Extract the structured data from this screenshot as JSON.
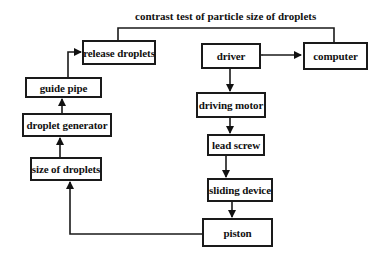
{
  "diagram": {
    "title": "contrast test of particle size of droplets",
    "nodes": {
      "release_droplets": "release droplets",
      "guide_pipe": "guide pipe",
      "droplet_generator": "droplet generator",
      "size_of_droplets": "size of droplets",
      "driver": "driver",
      "computer": "computer",
      "driving_motor": "driving motor",
      "lead_screw": "lead screw",
      "sliding_device": "sliding device",
      "piston": "piston"
    },
    "edges": [
      {
        "from": "driver",
        "to": "computer",
        "bidirectional": true
      },
      {
        "from": "driver",
        "to": "driving_motor"
      },
      {
        "from": "driving_motor",
        "to": "lead_screw"
      },
      {
        "from": "lead_screw",
        "to": "sliding_device"
      },
      {
        "from": "sliding_device",
        "to": "piston"
      },
      {
        "from": "piston",
        "to": "size_of_droplets"
      },
      {
        "from": "size_of_droplets",
        "to": "droplet_generator"
      },
      {
        "from": "droplet_generator",
        "to": "guide_pipe"
      },
      {
        "from": "guide_pipe",
        "to": "release_droplets"
      },
      {
        "from": "release_droplets",
        "to": "computer",
        "label": "contrast test of particle size of droplets"
      }
    ]
  }
}
